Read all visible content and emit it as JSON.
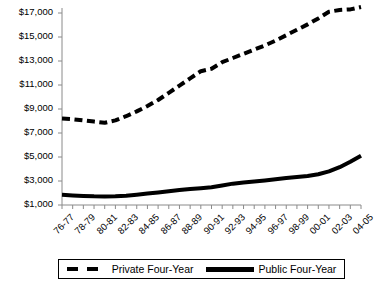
{
  "chart_data": {
    "type": "line",
    "title": "",
    "xlabel": "",
    "ylabel": "",
    "ylim": [
      1000,
      18000
    ],
    "ytick_values": [
      1000,
      3000,
      5000,
      7000,
      9000,
      11000,
      13000,
      15000,
      17000
    ],
    "ytick_labels": [
      "$1,000",
      "$3,000",
      "$5,000",
      "$7,000",
      "$9,000",
      "$11,000",
      "$13,000",
      "$15,000",
      "$17,000"
    ],
    "grid": false,
    "legend_position": "bottom",
    "categories": [
      "76-77",
      "77-78",
      "78-79",
      "79-80",
      "80-81",
      "81-82",
      "82-83",
      "83-84",
      "84-85",
      "85-86",
      "86-87",
      "87-88",
      "88-89",
      "89-90",
      "90-91",
      "91-92",
      "92-93",
      "93-94",
      "94-95",
      "95-96",
      "96-97",
      "97-98",
      "98-99",
      "99-00",
      "00-01",
      "01-02",
      "02-03",
      "03-04",
      "04-05"
    ],
    "xtick_labels": [
      "76-77",
      "78-79",
      "80-81",
      "82-83",
      "84-85",
      "86-87",
      "88-89",
      "90-91",
      "92-93",
      "94-95",
      "96-97",
      "98-99",
      "00-01",
      "02-03",
      "04-05"
    ],
    "series": [
      {
        "name": "Private Four-Year",
        "style": "dashed",
        "values": [
          8200,
          8150,
          8050,
          7950,
          7850,
          8050,
          8400,
          8800,
          9250,
          9750,
          10350,
          10950,
          11550,
          12150,
          12350,
          12900,
          13250,
          13600,
          13950,
          14300,
          14700,
          15150,
          15600,
          16050,
          16550,
          17100,
          17250,
          17300,
          17500
        ]
      },
      {
        "name": "Public Four-Year",
        "style": "solid",
        "values": [
          1850,
          1800,
          1760,
          1720,
          1700,
          1720,
          1780,
          1860,
          1950,
          2050,
          2150,
          2250,
          2330,
          2400,
          2480,
          2620,
          2780,
          2880,
          2960,
          3050,
          3150,
          3250,
          3330,
          3420,
          3560,
          3800,
          4150,
          4600,
          5100
        ]
      }
    ]
  },
  "legend": {
    "entries": [
      {
        "label": "Private Four-Year"
      },
      {
        "label": "Public Four-Year"
      }
    ]
  }
}
